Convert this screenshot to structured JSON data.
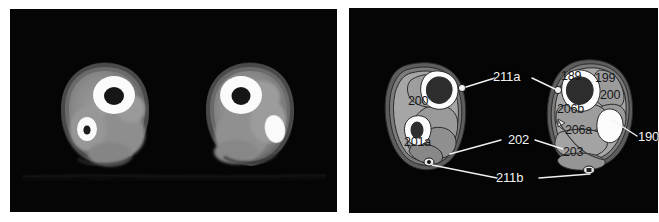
{
  "figure": {
    "type": "medical-imaging-figure",
    "panel_count": 2,
    "background_color": "#ffffff",
    "panel_background_color": "#050505"
  },
  "panels": {
    "ct": {
      "name": "axial-ct-scan-both-legs",
      "description": "Axial CT cross-section of both lower legs, grayscale",
      "structures_visible": [
        "tibia",
        "fibula",
        "muscle-compartments",
        "subcutaneous-fat",
        "skin-margin"
      ],
      "artifact_text": ""
    },
    "diagram": {
      "name": "labeled-anatomical-diagram",
      "description": "Matching labeled line drawing of the same axial section",
      "leader_line_color": "#f0f0f0"
    }
  },
  "labels": {
    "outside": [
      {
        "id": "label-211a",
        "text": "211a",
        "x": 463,
        "y": 77,
        "leaders": 2
      },
      {
        "id": "label-202",
        "text": "202",
        "x": 473,
        "y": 139,
        "leaders": 2
      },
      {
        "id": "label-211b",
        "text": "211b",
        "x": 464,
        "y": 166,
        "leaders": 2
      },
      {
        "id": "label-190",
        "text": "190",
        "x": 623,
        "y": 129,
        "leaders": 1
      }
    ],
    "inside_left_leg": [
      {
        "id": "label-200-left",
        "text": "200",
        "x": 408,
        "y": 95
      },
      {
        "id": "label-201a",
        "text": "201a",
        "x": 408,
        "y": 137
      }
    ],
    "inside_right_leg": [
      {
        "id": "label-189",
        "text": "189",
        "x": 560,
        "y": 71
      },
      {
        "id": "label-199",
        "text": "199",
        "x": 593,
        "y": 73
      },
      {
        "id": "label-200-right",
        "text": "200",
        "x": 597,
        "y": 90
      },
      {
        "id": "label-206b",
        "text": "206b",
        "x": 559,
        "y": 104
      },
      {
        "id": "label-206a",
        "text": "206a",
        "x": 565,
        "y": 125
      },
      {
        "id": "label-203",
        "text": "203",
        "x": 562,
        "y": 147
      }
    ]
  },
  "colors": {
    "panel_bg": "#050505",
    "skin_outline": "#3f3f3f",
    "fat_layer": "#6f6f6f",
    "muscle_light": "#a8a8a8",
    "muscle_mid": "#909090",
    "muscle_dark": "#7c7c7c",
    "bone_cortex": "#fdfdfd",
    "bone_marrow": "#2d2d2d",
    "label_light": "#f2f2f2",
    "label_dark": "#17181a"
  }
}
